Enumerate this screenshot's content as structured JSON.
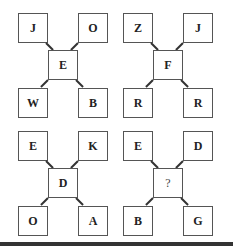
{
  "figure": {
    "type": "letter-puzzle",
    "puzzles": [
      {
        "id": "p1",
        "top_left": "J",
        "top_right": "O",
        "center": "E",
        "bottom_left": "W",
        "bottom_right": "B"
      },
      {
        "id": "p2",
        "top_left": "Z",
        "top_right": "J",
        "center": "F",
        "bottom_left": "R",
        "bottom_right": "R"
      },
      {
        "id": "p3",
        "top_left": "E",
        "top_right": "K",
        "center": "D",
        "bottom_left": "O",
        "bottom_right": "A"
      },
      {
        "id": "p4",
        "top_left": "E",
        "top_right": "D",
        "center": "?",
        "bottom_left": "B",
        "bottom_right": "G"
      }
    ]
  },
  "colors": {
    "border": "#555555",
    "text": "#222222",
    "bar": "#333333"
  }
}
